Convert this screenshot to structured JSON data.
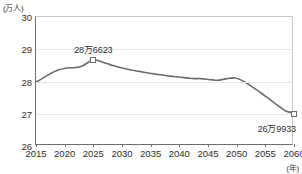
{
  "axes": {
    "y_unit_label": "(万人)",
    "x_unit_label": "(年)",
    "y_ticks": [
      "26",
      "27",
      "28",
      "29",
      "30"
    ],
    "x_ticks": [
      "2015",
      "2020",
      "2025",
      "2030",
      "2035",
      "2040",
      "2045",
      "2050",
      "2055",
      "2060"
    ]
  },
  "annotations": {
    "peak_label": "28万6623",
    "end_label": "26万9933"
  },
  "chart_data": {
    "type": "line",
    "title": "",
    "xlabel": "(年)",
    "ylabel": "(万人)",
    "xlim": [
      2015,
      2060
    ],
    "ylim": [
      26,
      30
    ],
    "grid": true,
    "legend": false,
    "line_color": "#6b6b6b",
    "x": [
      2015,
      2016,
      2017,
      2018,
      2019,
      2020,
      2021,
      2022,
      2023,
      2024,
      2025,
      2026,
      2027,
      2028,
      2029,
      2030,
      2031,
      2032,
      2033,
      2034,
      2035,
      2036,
      2037,
      2038,
      2039,
      2040,
      2041,
      2042,
      2043,
      2044,
      2045,
      2046,
      2047,
      2048,
      2049,
      2050,
      2051,
      2052,
      2053,
      2054,
      2055,
      2056,
      2057,
      2058,
      2059,
      2060
    ],
    "values": [
      27.95,
      28.05,
      28.16,
      28.26,
      28.34,
      28.38,
      28.4,
      28.41,
      28.45,
      28.55,
      28.66,
      28.62,
      28.56,
      28.5,
      28.45,
      28.4,
      28.36,
      28.32,
      28.29,
      28.26,
      28.23,
      28.2,
      28.18,
      28.15,
      28.13,
      28.11,
      28.09,
      28.07,
      28.06,
      28.06,
      28.04,
      28.02,
      28.01,
      28.04,
      28.07,
      28.08,
      28.02,
      27.92,
      27.8,
      27.68,
      27.55,
      27.42,
      27.28,
      27.15,
      27.03,
      26.99
    ],
    "markers": [
      {
        "x": 2025,
        "y": 28.66,
        "label": "28万6623"
      },
      {
        "x": 2060,
        "y": 26.99,
        "label": "26万9933"
      }
    ],
    "annotation_positions": [
      {
        "label_key": "peak_label",
        "x": 2025,
        "y": 29.0,
        "placement": "above"
      },
      {
        "label_key": "end_label",
        "x": 2057,
        "y": 26.55,
        "placement": "below-left"
      }
    ]
  }
}
